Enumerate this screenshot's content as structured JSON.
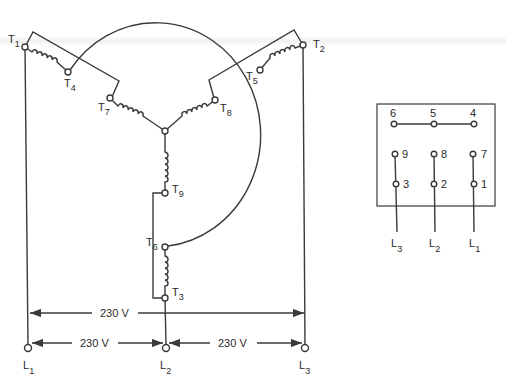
{
  "diagram": {
    "terminals": {
      "T1": {
        "label": "T",
        "sub": "1"
      },
      "T2": {
        "label": "T",
        "sub": "2"
      },
      "T3": {
        "label": "T",
        "sub": "3"
      },
      "T4": {
        "label": "T",
        "sub": "4"
      },
      "T5": {
        "label": "T",
        "sub": "5"
      },
      "T6": {
        "label": "T",
        "sub": "6"
      },
      "T7": {
        "label": "T",
        "sub": "7"
      },
      "T8": {
        "label": "T",
        "sub": "8"
      },
      "T9": {
        "label": "T",
        "sub": "9"
      }
    },
    "lines": {
      "L1": {
        "label": "L",
        "sub": "1"
      },
      "L2": {
        "label": "L",
        "sub": "2"
      },
      "L3": {
        "label": "L",
        "sub": "3"
      }
    },
    "voltages": {
      "l1_l3": "230 V",
      "l1_l2": "230 V",
      "l2_l3": "230 V"
    },
    "terminal_board": {
      "top_row": [
        "6",
        "5",
        "4"
      ],
      "middle_row": [
        "9",
        "8",
        "7"
      ],
      "bottom_row": [
        "3",
        "2",
        "1"
      ],
      "line_labels": [
        {
          "label": "L",
          "sub": "3"
        },
        {
          "label": "L",
          "sub": "2"
        },
        {
          "label": "L",
          "sub": "1"
        }
      ]
    }
  }
}
